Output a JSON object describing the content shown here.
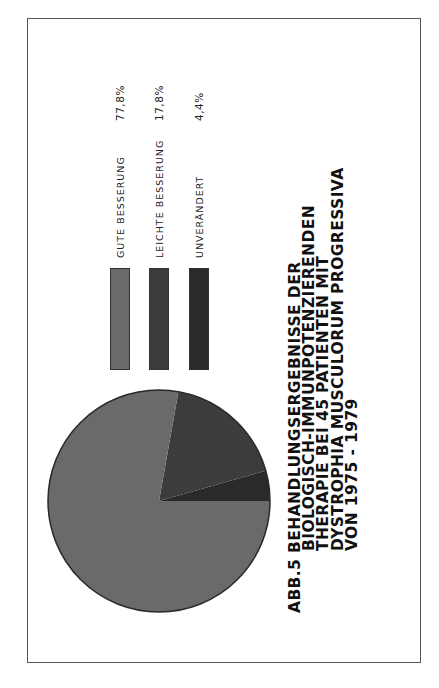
{
  "chart_data": {
    "type": "pie",
    "title_lines": [
      "ABB.5  BEHANDLUNGSERGEBNISSE  DER",
      "BIOLOGISCH-IMMUNPOTENZIERENDEN",
      "THERAPIE  BEI  45  PATIENTEN  MIT",
      "DYSTROPHIA  MUSCULORUM  PROGRESSIVA",
      "VON  1975 - 1979"
    ],
    "categories": [
      "GUTE BESSERUNG",
      "LEICHTE BESSERUNG",
      "UNVERÄNDERT"
    ],
    "values": [
      77.8,
      17.8,
      4.4
    ],
    "value_labels": [
      "77,8%",
      "17,8%",
      "4,4%"
    ],
    "colors": [
      "#6a6a6a",
      "#3c3c3c",
      "#2a2a2a"
    ],
    "unit": "%",
    "legend_position": "right",
    "orientation": "page rotated 90° counter-clockwise"
  }
}
